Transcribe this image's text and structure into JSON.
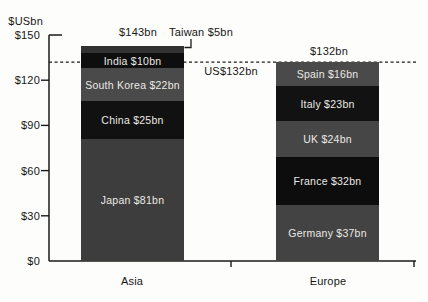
{
  "chart_data": {
    "type": "bar",
    "stacked": true,
    "title": "",
    "ylabel": "$USbn",
    "xlabel": "",
    "ylim": [
      0,
      150
    ],
    "yticks": [
      0,
      30,
      60,
      90,
      120,
      150
    ],
    "ytick_labels": [
      "$0",
      "$30",
      "$60",
      "$90",
      "$120",
      "$150"
    ],
    "grid": false,
    "reference_line": {
      "value": 132,
      "label": "US$132bn",
      "style": "dashed"
    },
    "categories": [
      "Asia",
      "Europe"
    ],
    "bars": [
      {
        "category": "Asia",
        "total": 143,
        "total_label": "$143bn",
        "segments": [
          {
            "name": "Japan",
            "label": "Japan $81bn",
            "value": 81,
            "color": "#3d3d3d"
          },
          {
            "name": "China",
            "label": "China $25bn",
            "value": 25,
            "color": "#111111"
          },
          {
            "name": "South Korea",
            "label": "South Korea $22bn",
            "value": 22,
            "color": "#4a4a4a"
          },
          {
            "name": "India",
            "label": "India $10bn",
            "value": 10,
            "color": "#0e0e0e"
          },
          {
            "name": "Taiwan",
            "label": "",
            "value": 5,
            "color": "#323232",
            "callout_label": "Taiwan $5bn"
          }
        ]
      },
      {
        "category": "Europe",
        "total": 132,
        "total_label": "$132bn",
        "segments": [
          {
            "name": "Germany",
            "label": "Germany $37bn",
            "value": 37,
            "color": "#434343"
          },
          {
            "name": "France",
            "label": "France $32bn",
            "value": 32,
            "color": "#0d0d0d"
          },
          {
            "name": "UK",
            "label": "UK $24bn",
            "value": 24,
            "color": "#464646"
          },
          {
            "name": "Italy",
            "label": "Italy $23bn",
            "value": 23,
            "color": "#121212"
          },
          {
            "name": "Spain",
            "label": "Spain $16bn",
            "value": 16,
            "color": "#4a4a4a"
          }
        ]
      }
    ],
    "colors": {
      "segment_text": "#ebe9e5",
      "axis": "#1a1a1a",
      "background": "#fdfdfb"
    }
  }
}
